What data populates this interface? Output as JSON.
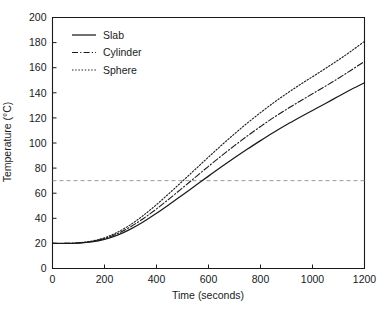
{
  "chart_data": {
    "type": "line",
    "title": "",
    "xlabel": "Time (seconds)",
    "ylabel": "Temperature (°C)",
    "xlim": [
      0,
      1200
    ],
    "ylim": [
      0,
      200
    ],
    "xticks": [
      0,
      200,
      400,
      600,
      800,
      1000,
      1200
    ],
    "yticks": [
      0,
      20,
      40,
      60,
      80,
      100,
      120,
      140,
      160,
      180,
      200
    ],
    "grid": false,
    "legend_position": "upper-left-inside",
    "background_color": "#ffffff",
    "line_color": "#1a1a1a",
    "reference_line_color": "#8c8c8c",
    "x": [
      0,
      50,
      100,
      150,
      200,
      250,
      300,
      350,
      400,
      450,
      500,
      550,
      600,
      650,
      700,
      750,
      800,
      850,
      900,
      950,
      1000,
      1050,
      1100,
      1150,
      1200
    ],
    "series": [
      {
        "name": "Slab",
        "style": "solid",
        "values": [
          20,
          20,
          20.3,
          21.2,
          23.2,
          26.6,
          31.4,
          37.3,
          44.0,
          51.2,
          58.6,
          66.1,
          73.6,
          81.0,
          88.2,
          95.2,
          101.9,
          108.4,
          114.5,
          120.3,
          125.9,
          131.5,
          137.2,
          142.8,
          148.0
        ]
      },
      {
        "name": "Cylinder",
        "style": "dash-dot",
        "values": [
          20,
          20,
          20.4,
          21.5,
          23.9,
          27.8,
          33.2,
          39.9,
          47.5,
          55.7,
          64.2,
          72.8,
          81.4,
          89.8,
          97.9,
          105.7,
          113.1,
          120.2,
          126.8,
          133.1,
          139.2,
          145.3,
          151.6,
          158.2,
          165.0
        ]
      },
      {
        "name": "Sphere",
        "style": "dotted",
        "values": [
          20,
          20,
          20.5,
          21.8,
          24.5,
          28.9,
          34.9,
          42.4,
          50.9,
          60.1,
          69.6,
          79.2,
          88.8,
          98.2,
          107.3,
          116.0,
          124.2,
          132.0,
          139.3,
          146.2,
          152.8,
          159.4,
          166.2,
          173.4,
          181.0
        ]
      }
    ],
    "reference_line": {
      "label": "",
      "orientation": "horizontal",
      "value": 70,
      "style": "dashed"
    },
    "crossings": [
      {
        "series": "Sphere",
        "x": 500,
        "y": 70
      },
      {
        "series": "Cylinder",
        "x": 535,
        "y": 70
      },
      {
        "series": "Slab",
        "x": 570,
        "y": 70
      }
    ]
  },
  "legend": {
    "entries": [
      {
        "label": "Slab"
      },
      {
        "label": "Cylinder"
      },
      {
        "label": "Sphere"
      }
    ]
  },
  "axes": {
    "x_title": "Time (seconds)",
    "y_title": "Temperature (°C)",
    "x_tick_labels": [
      "0",
      "200",
      "400",
      "600",
      "800",
      "1000",
      "1200"
    ],
    "y_tick_labels": [
      "0",
      "20",
      "40",
      "60",
      "80",
      "100",
      "120",
      "140",
      "160",
      "180",
      "200"
    ]
  }
}
